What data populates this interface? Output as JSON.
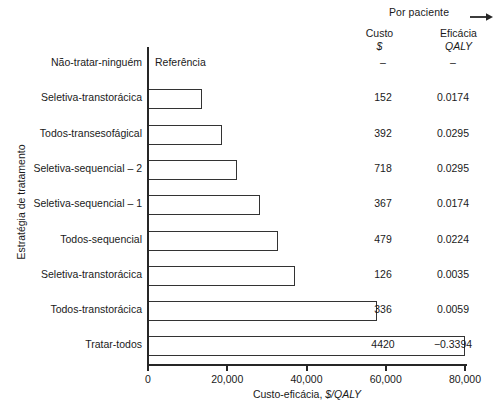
{
  "header": {
    "group_title": "Por paciente",
    "cost_col": {
      "label": "Custo",
      "unit": "$"
    },
    "eff_col": {
      "label": "Eficácia",
      "unit": "QALY"
    }
  },
  "axes": {
    "ytitle": "Estratégia de tratamento",
    "xtitle_plain": "Custo-eficácia, ",
    "xtitle_italic": "$/QALY",
    "xticklabels": [
      "0",
      "20,000",
      "40,000",
      "60,000",
      "80,000"
    ]
  },
  "reference_text": "Referência",
  "dash": "–",
  "rows": [
    {
      "strategy": "Não-tratar-ninguém",
      "value": null,
      "cost": "–",
      "eff": "–"
    },
    {
      "strategy": "Seletiva-transtorácica",
      "value": 13600,
      "cost": "152",
      "eff": "0.0174"
    },
    {
      "strategy": "Todos-transesofágical",
      "value": 18700,
      "cost": "392",
      "eff": "0.0295"
    },
    {
      "strategy": "Seletiva-sequencial – 2",
      "value": 22500,
      "cost": "718",
      "eff": "0.0295"
    },
    {
      "strategy": "Seletiva-sequencial – 1",
      "value": 28300,
      "cost": "367",
      "eff": "0.0174"
    },
    {
      "strategy": "Todos-sequencial",
      "value": 32800,
      "cost": "479",
      "eff": "0.0224"
    },
    {
      "strategy": "Seletiva-transtorácica",
      "value": 37100,
      "cost": "126",
      "eff": "0.0035"
    },
    {
      "strategy": "Todos-transtorácica",
      "value": 57800,
      "cost": "336",
      "eff": "0.0059"
    },
    {
      "strategy": "Tratar-todos",
      "value": 80000,
      "cost": "4420",
      "eff": "−0.3394"
    }
  ],
  "chart_data": {
    "type": "bar",
    "orientation": "horizontal",
    "title": "",
    "xlabel": "Custo-eficácia, $/QALY",
    "ylabel": "Estratégia de tratamento",
    "xlim": [
      0,
      80000
    ],
    "xticks": [
      0,
      20000,
      40000,
      60000,
      80000
    ],
    "grid": false,
    "legend": false,
    "categories": [
      "Não-tratar-ninguém",
      "Seletiva-transtorácica",
      "Todos-transesofágical",
      "Seletiva-sequencial – 2",
      "Seletiva-sequencial – 1",
      "Todos-sequencial",
      "Seletiva-transtorácica",
      "Todos-transtorácica",
      "Tratar-todos"
    ],
    "values": [
      0,
      13600,
      18700,
      22500,
      28300,
      32800,
      37100,
      57800,
      80000
    ],
    "annotations": {
      "reference_row": "Referência",
      "last_bar_arrow": "extends beyond 80,000"
    },
    "series": [
      {
        "name": "Custo $ (por paciente)",
        "values": [
          null,
          152,
          392,
          718,
          367,
          479,
          126,
          336,
          4420
        ]
      },
      {
        "name": "Eficácia QALY (por paciente)",
        "values": [
          null,
          0.0174,
          0.0295,
          0.0295,
          0.0174,
          0.0224,
          0.0035,
          0.0059,
          -0.3394
        ]
      }
    ]
  }
}
